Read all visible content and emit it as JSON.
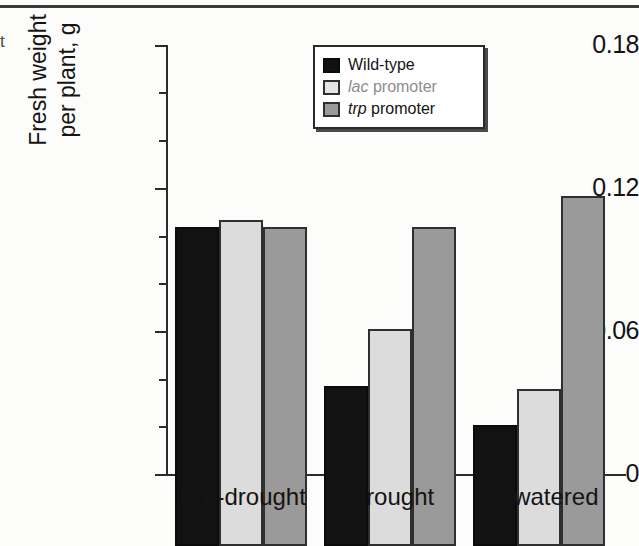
{
  "chart_data": {
    "type": "bar",
    "title": "",
    "xlabel": "",
    "ylabel": "Fresh weight per plant, g",
    "ylabel_line1": "Fresh weight",
    "ylabel_line2": "per plant, g",
    "categories": [
      "Pre-drought",
      "Drought",
      "Rewatered"
    ],
    "series": [
      {
        "name": "Wild-type",
        "color": "#121212",
        "values": [
          0.134,
          0.067,
          0.051
        ]
      },
      {
        "name": "lac promoter",
        "color": "#dcdcdc",
        "values": [
          0.137,
          0.091,
          0.066
        ]
      },
      {
        "name": "trp promoter",
        "color": "#9a9a9a",
        "values": [
          0.134,
          0.134,
          0.147
        ]
      }
    ],
    "ylim": [
      0,
      0.18
    ],
    "ytick_labels": [
      "0",
      "0.06",
      "0.12",
      "0.18"
    ],
    "ytick_values": [
      0,
      0.06,
      0.12,
      0.18
    ],
    "yminor_values": [
      0.01,
      0.02,
      0.03,
      0.04,
      0.05,
      0.07,
      0.08,
      0.09,
      0.1,
      0.11,
      0.13,
      0.14,
      0.15,
      0.16,
      0.17
    ],
    "grid": false,
    "legend_position": "top-center"
  },
  "legend": {
    "items": [
      {
        "label": "Wild-type",
        "label_italic": "",
        "label_rest": "Wild-type",
        "swatch": "wild-type-swatch"
      },
      {
        "label": "lac promoter",
        "label_italic": "lac",
        "label_rest": " promoter",
        "swatch": "lac-promoter-swatch"
      },
      {
        "label": "trp promoter",
        "label_italic": "trp",
        "label_rest": " promoter",
        "swatch": "trp-promoter-swatch"
      }
    ]
  },
  "axes": {
    "y_title_line1": "Fresh weight",
    "y_title_line2": "per plant, g",
    "y_ticks": [
      "0.18",
      "0.12",
      "0.06",
      "0"
    ],
    "x_ticks": [
      "Pre-drought",
      "Drought",
      "Rewatered"
    ]
  },
  "page_marks": {
    "stray_top_left": "t",
    "stray_mid_left": ""
  },
  "colors": {
    "wild_type": "#121212",
    "lac_promoter": "#dcdcdc",
    "trp_promoter": "#9a9a9a",
    "axis": "#2b2b2b",
    "text": "#141414"
  }
}
